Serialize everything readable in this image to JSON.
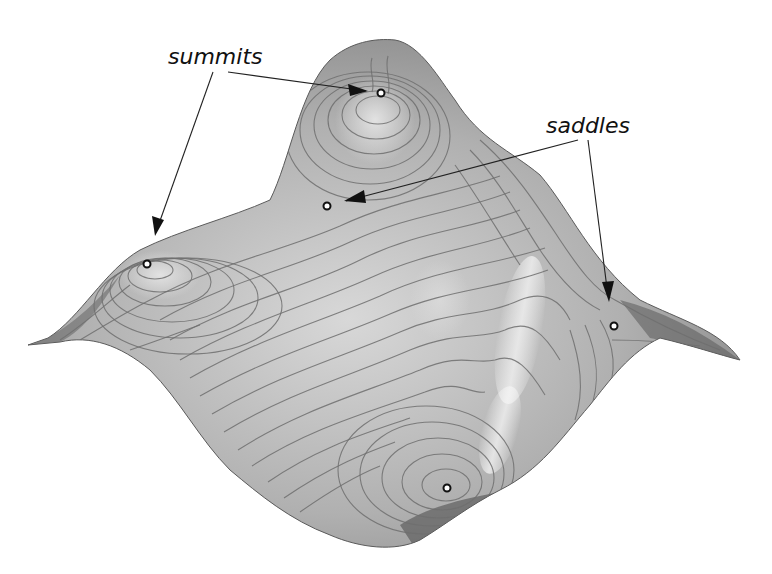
{
  "figure": {
    "type": "3d-terrain-surface-with-contours",
    "colors": {
      "background": "#ffffff",
      "surface_light": "#d4d4d4",
      "surface_mid": "#a8a8a8",
      "surface_dark": "#6a6a6a",
      "contour": "#6e6e6e",
      "text": "#111111"
    },
    "labels": {
      "summits": "summits",
      "saddles": "saddles"
    },
    "critical_points": [
      {
        "kind": "summit",
        "x": 381,
        "y": 93
      },
      {
        "kind": "summit",
        "x": 147,
        "y": 264
      },
      {
        "kind": "summit",
        "x": 447,
        "y": 488
      },
      {
        "kind": "saddle",
        "x": 327,
        "y": 206
      },
      {
        "kind": "saddle",
        "x": 614,
        "y": 326
      }
    ]
  }
}
